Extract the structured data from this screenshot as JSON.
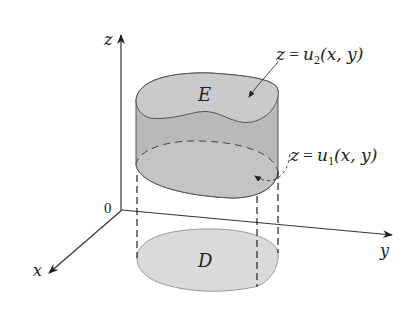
{
  "figure": {
    "axes": {
      "z_label": "z",
      "y_label": "y",
      "x_label": "x",
      "origin_label": "0"
    },
    "regions": {
      "solid_label": "E",
      "base_label": "D"
    },
    "annotations": {
      "upper_surface": {
        "lhs": "z",
        "eq": " = ",
        "fn": "u",
        "sub": "2",
        "args": "(x, y)"
      },
      "lower_surface": {
        "lhs": "z",
        "eq": " = ",
        "fn": "u",
        "sub": "1",
        "args": "(x, y)"
      }
    },
    "colors": {
      "solid_side": "#b9b9b9",
      "solid_top": "#c9c9c9",
      "bottom_surface": "#c4c4c4",
      "base_region": "#dadada",
      "outline": "#555555",
      "axis": "#333333"
    }
  }
}
